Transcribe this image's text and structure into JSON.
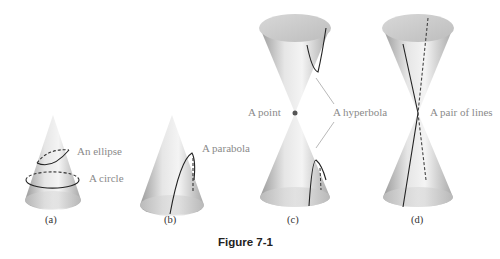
{
  "figure": {
    "title": "Figure 7-1",
    "panels": [
      {
        "id": "a",
        "caption": "(a)",
        "labels": [
          "An ellipse",
          "A circle"
        ]
      },
      {
        "id": "b",
        "caption": "(b)",
        "labels": [
          "A parabola"
        ]
      },
      {
        "id": "c",
        "caption": "(c)",
        "labels": [
          "A point",
          "A hyperbola"
        ]
      },
      {
        "id": "d",
        "caption": "(d)",
        "labels": [
          "A pair of lines"
        ]
      }
    ]
  }
}
